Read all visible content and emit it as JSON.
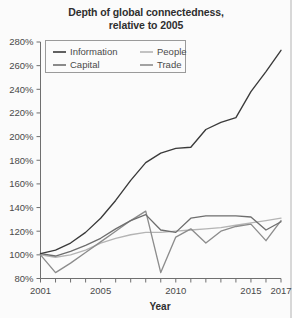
{
  "chart": {
    "title_line1": "Depth of global connectedness,",
    "title_line2": "relative to 2005",
    "xlabel": "Year",
    "ylabel": ""
  },
  "chart_data": {
    "type": "line",
    "title": "Depth of global connectedness, relative to 2005",
    "xlabel": "Year",
    "ylabel": "",
    "xlim": [
      2001,
      2017
    ],
    "ylim": [
      80,
      280
    ],
    "ytick_labels": [
      "80%",
      "100%",
      "120%",
      "140%",
      "160%",
      "180%",
      "200%",
      "220%",
      "240%",
      "260%",
      "280%"
    ],
    "ytick_values": [
      80,
      100,
      120,
      140,
      160,
      180,
      200,
      220,
      240,
      260,
      280
    ],
    "xtick_values": [
      2001,
      2002,
      2003,
      2004,
      2005,
      2006,
      2007,
      2008,
      2009,
      2010,
      2011,
      2012,
      2013,
      2014,
      2015,
      2016,
      2017
    ],
    "xtick_labels_shown": [
      "2001",
      "2005",
      "2010",
      "2015",
      "2017"
    ],
    "xtick_labels_shown_values": [
      2001,
      2005,
      2010,
      2015,
      2017
    ],
    "grid": false,
    "legend_position": "upper left",
    "x": [
      2001,
      2002,
      2003,
      2004,
      2005,
      2006,
      2007,
      2008,
      2009,
      2010,
      2011,
      2012,
      2013,
      2014,
      2015,
      2016,
      2017
    ],
    "series": [
      {
        "name": "Information",
        "color": "#3a3a3a",
        "values": [
          101,
          104,
          110,
          119,
          131,
          146,
          163,
          178,
          186,
          190,
          191,
          206,
          212,
          216,
          238,
          255,
          273
        ]
      },
      {
        "name": "People",
        "color": "#b4b4b4",
        "values": [
          100,
          98,
          100,
          104,
          110,
          114,
          117,
          119,
          119,
          120,
          121,
          122,
          123,
          125,
          127,
          129,
          131
        ]
      },
      {
        "name": "Capital",
        "color": "#6e6e6e",
        "values": [
          101,
          99,
          103,
          108,
          114,
          122,
          129,
          134,
          121,
          119,
          131,
          133,
          133,
          133,
          132,
          121,
          128
        ]
      },
      {
        "name": "Trade",
        "color": "#8c8c8c",
        "values": [
          100,
          85,
          93,
          102,
          111,
          120,
          129,
          137,
          85,
          115,
          122,
          110,
          120,
          124,
          126,
          112,
          129
        ]
      }
    ]
  },
  "legend": {
    "items": [
      {
        "label": "Information",
        "color": "#3a3a3a"
      },
      {
        "label": "People",
        "color": "#b4b4b4"
      },
      {
        "label": "Capital",
        "color": "#6e6e6e"
      },
      {
        "label": "Trade",
        "color": "#8c8c8c"
      }
    ]
  }
}
